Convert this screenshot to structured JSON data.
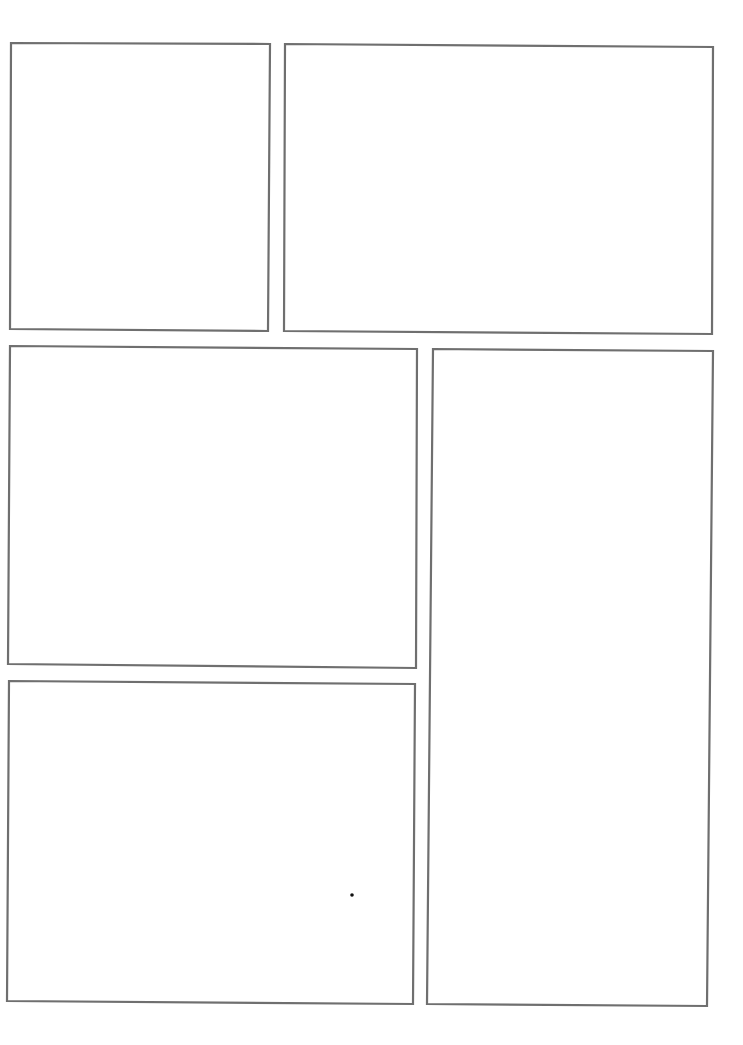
{
  "page": {
    "type": "blank comic page template",
    "background": "#ffffff",
    "border_color": "#6f6f6f",
    "panel_count": 5
  },
  "panels": [
    {
      "id": "panel-1",
      "position": "top-left",
      "points": "11,43 270,44 268,331 10,329"
    },
    {
      "id": "panel-2",
      "position": "top-right",
      "points": "285,44 713,47 712,334 284,331"
    },
    {
      "id": "panel-3",
      "position": "middle-left",
      "points": "10,346 417,349 416,668 8,664"
    },
    {
      "id": "panel-4",
      "position": "bottom-left",
      "points": "9,681 415,684 413,1004 7,1001"
    },
    {
      "id": "panel-5",
      "position": "right-tall",
      "points": "433,349 713,351 707,1006 427,1004"
    }
  ],
  "marks": [
    {
      "id": "speck",
      "cx": 352,
      "cy": 895,
      "r": 1.8
    }
  ]
}
